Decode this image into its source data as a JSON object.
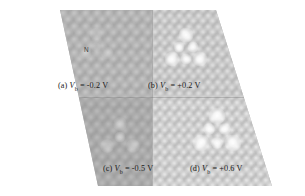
{
  "figure": {
    "kind": "stm-topography-panels",
    "shape": "parallelogram",
    "background_color": "#ffffff",
    "lattice_color": "#bcbcbc",
    "highlight_color": "#ffffff",
    "caption_color": "#1a1a1a"
  },
  "annotations": {
    "nitrogen_label": "N"
  },
  "panels": [
    {
      "id": "a",
      "caption_prefix": "(a)",
      "symbol": "V",
      "subscript": "b",
      "equals": "=",
      "value": "-0.2 V",
      "caption": "(a) Vb = -0.2 V",
      "bias_volts": -0.2,
      "defect_visibility": "faint"
    },
    {
      "id": "b",
      "caption_prefix": "(b)",
      "symbol": "V",
      "subscript": "b",
      "equals": "=",
      "value": "+0.2 V",
      "caption": "(b) Vb = +0.2 V",
      "bias_volts": 0.2,
      "defect_visibility": "strong"
    },
    {
      "id": "c",
      "caption_prefix": "(c)",
      "symbol": "V",
      "subscript": "b",
      "equals": "=",
      "value": "-0.5 V",
      "caption": "(c) Vb = -0.5 V",
      "bias_volts": -0.5,
      "defect_visibility": "weak"
    },
    {
      "id": "d",
      "caption_prefix": "(d)",
      "symbol": "V",
      "subscript": "b",
      "equals": "=",
      "value": "+0.6 V",
      "caption": "(d) Vb = +0.6 V",
      "bias_volts": 0.6,
      "defect_visibility": "strong"
    }
  ]
}
